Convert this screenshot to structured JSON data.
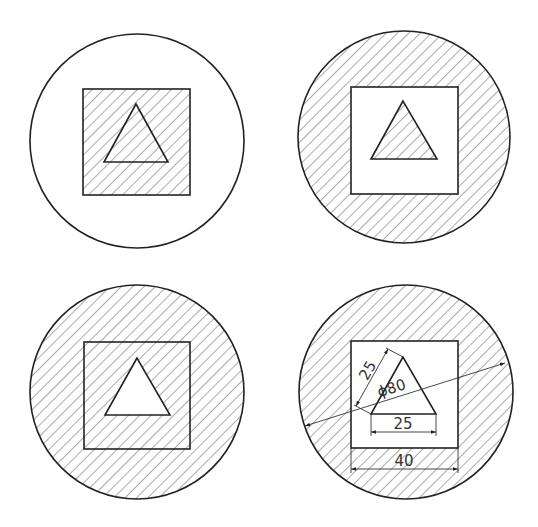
{
  "diagram": {
    "title": "",
    "panels": [
      {
        "id": "top-left",
        "hatched": [
          "square",
          "triangle"
        ],
        "unhatched": [
          "ring"
        ]
      },
      {
        "id": "top-right",
        "hatched": [
          "ring",
          "triangle"
        ],
        "unhatched": [
          "square-minus-triangle"
        ]
      },
      {
        "id": "bottom-left",
        "hatched": [
          "ring",
          "square-minus-triangle"
        ],
        "unhatched": [
          "triangle"
        ]
      },
      {
        "id": "bottom-right",
        "hatched": [
          "ring"
        ],
        "unhatched": [
          "square-minus-triangle",
          "triangle"
        ]
      }
    ],
    "dimensions": {
      "triangle_side": "25",
      "triangle_base": "25",
      "square_width": "40",
      "circle_diameter": "ϕ80"
    },
    "colors": {
      "line": "#222222",
      "hatch": "#444444",
      "background": "#ffffff"
    }
  }
}
